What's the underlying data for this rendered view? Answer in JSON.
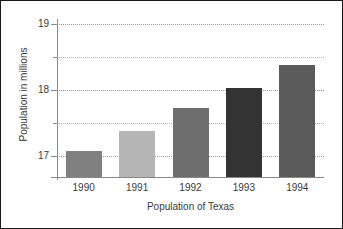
{
  "chart_data": {
    "type": "bar",
    "title": "",
    "xlabel": "Population of Texas",
    "ylabel": "Population in millions",
    "categories": [
      "1990",
      "1991",
      "1992",
      "1993",
      "1994"
    ],
    "values": [
      17.07,
      17.38,
      17.72,
      18.03,
      18.38
    ],
    "bar_colors": [
      "#808080",
      "#b5b5b5",
      "#6e6e6e",
      "#333333",
      "#5a5a5a"
    ],
    "ylim": [
      16.75,
      19.0
    ],
    "yticks": [
      17,
      18,
      19
    ],
    "ytick_labels": [
      "17",
      "18",
      "19"
    ],
    "minor_gridlines": [
      17.5,
      18.5
    ],
    "grid": true,
    "grid_style": "dotted",
    "legend": "none",
    "frame_color": "#1a1a1a",
    "axis_color": "#8a8a8a",
    "text_color": "#3a3a3a"
  }
}
